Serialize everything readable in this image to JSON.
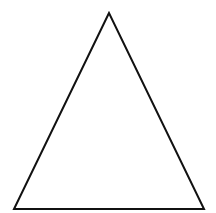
{
  "diagram": {
    "shape": "triangle",
    "fill": "#ffffff",
    "stroke": "#111111",
    "stroke_width": 2,
    "vertices": [
      [
        109,
        13
      ],
      [
        14,
        209
      ],
      [
        204,
        209
      ]
    ],
    "points_attr": "109,13 14,209 204,209"
  }
}
